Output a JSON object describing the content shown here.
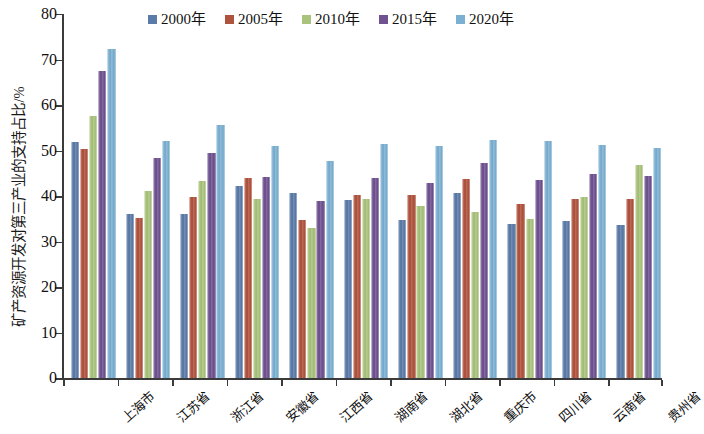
{
  "chart_data": {
    "type": "bar",
    "title": "",
    "xlabel": "",
    "ylabel": "矿产资源开发对第三产业的支持占比/%",
    "ylim": [
      0,
      80
    ],
    "ytick_step": 10,
    "yticks": [
      0,
      10,
      20,
      30,
      40,
      50,
      60,
      70,
      80
    ],
    "grid": false,
    "legend_position": "top-center",
    "categories": [
      "上海市",
      "江苏省",
      "浙江省",
      "安徽省",
      "江西省",
      "湖南省",
      "湖北省",
      "重庆市",
      "四川省",
      "云南省",
      "贵州省"
    ],
    "series": [
      {
        "name": "2000年",
        "color": "#5b7ba8",
        "values": [
          51.8,
          36.0,
          36.2,
          42.2,
          40.7,
          39.1,
          34.7,
          40.8,
          33.9,
          34.5,
          33.7
        ]
      },
      {
        "name": "2005年",
        "color": "#b0533e",
        "values": [
          50.3,
          35.2,
          39.9,
          44.1,
          34.7,
          40.3,
          40.2,
          43.7,
          38.4,
          39.4,
          39.3
        ]
      },
      {
        "name": "2010年",
        "color": "#a9c37c",
        "values": [
          57.7,
          41.2,
          43.3,
          39.4,
          33.0,
          39.4,
          37.8,
          36.5,
          35.0,
          39.8,
          46.8
        ]
      },
      {
        "name": "2015年",
        "color": "#6f5290",
        "values": [
          67.5,
          48.4,
          49.5,
          44.3,
          38.9,
          44.0,
          42.8,
          47.3,
          43.5,
          44.8,
          44.5
        ]
      },
      {
        "name": "2020年",
        "color": "#7cb0d2",
        "values": [
          72.3,
          52.2,
          55.6,
          51.0,
          47.8,
          51.5,
          51.0,
          52.4,
          52.2,
          51.2,
          50.5
        ]
      }
    ]
  },
  "axis": {
    "y_title": "矿产资源开发对第三产业的支持占比/%"
  }
}
